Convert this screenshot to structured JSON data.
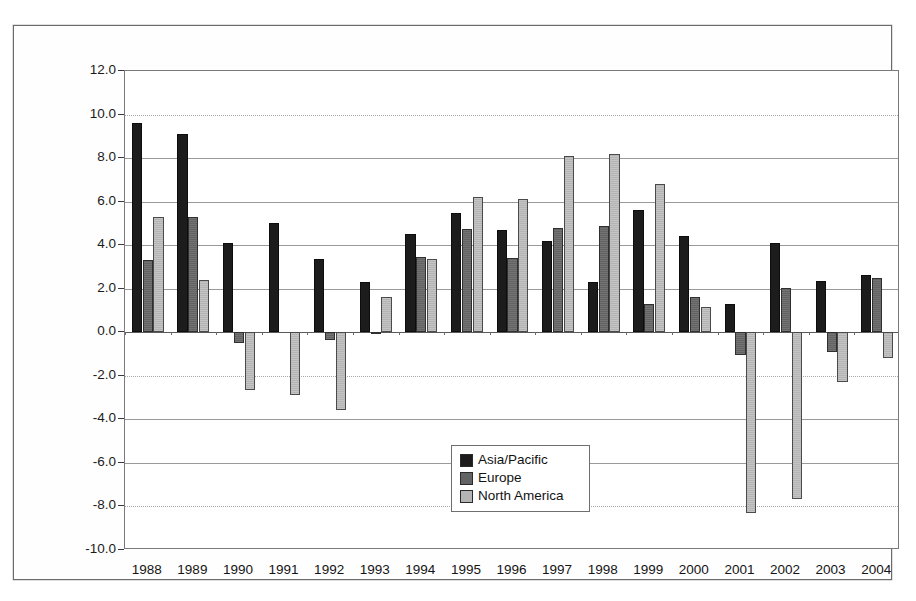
{
  "chart_data": {
    "type": "bar",
    "title": "",
    "subtitle": "",
    "xlabel": "",
    "ylabel": "Operating profit as % Revenues",
    "ylim": [
      -10.0,
      12.0
    ],
    "ytick_step": 2.0,
    "grid": true,
    "legend_position": "inside-center-lower",
    "categories": [
      "1988",
      "1989",
      "1990",
      "1991",
      "1992",
      "1993",
      "1994",
      "1995",
      "1996",
      "1997",
      "1998",
      "1999",
      "2000",
      "2001",
      "2002",
      "2003",
      "2004"
    ],
    "ytick_labels": [
      "12.0",
      "10.0",
      "8.0",
      "6.0",
      "4.0",
      "2.0",
      "0.0",
      "-2.0",
      "-4.0",
      "-6.0",
      "-8.0",
      "-10.0"
    ],
    "series": [
      {
        "name": "Asia/Pacific",
        "color": "#1c1c1c",
        "values": [
          9.6,
          9.1,
          4.1,
          5.0,
          3.35,
          2.3,
          4.5,
          5.5,
          4.7,
          4.2,
          2.3,
          5.6,
          4.4,
          1.3,
          4.1,
          2.35,
          2.65
        ]
      },
      {
        "name": "Europe",
        "color": "#636363",
        "values": [
          3.3,
          5.3,
          -0.5,
          0.0,
          -0.35,
          -0.1,
          3.45,
          4.75,
          3.4,
          4.8,
          4.9,
          1.3,
          1.6,
          -1.05,
          2.05,
          -0.9,
          2.5
        ]
      },
      {
        "name": "North America",
        "color": "#b4b4b4",
        "values": [
          5.3,
          2.4,
          -2.65,
          -2.9,
          -3.55,
          1.6,
          3.35,
          6.2,
          6.1,
          8.1,
          8.2,
          6.8,
          1.15,
          -8.3,
          -7.65,
          -2.3,
          -1.2
        ]
      }
    ]
  },
  "legend": {
    "items": [
      {
        "label": "Asia/Pacific"
      },
      {
        "label": "Europe"
      },
      {
        "label": "North America"
      }
    ]
  }
}
